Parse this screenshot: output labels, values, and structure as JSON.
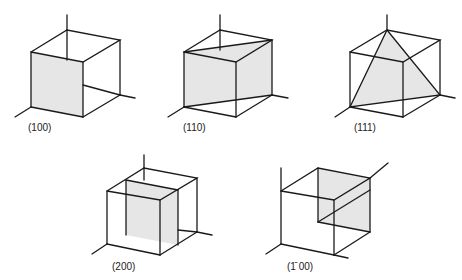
{
  "figure": {
    "panels": [
      {
        "id": "p100",
        "label": "(100)"
      },
      {
        "id": "p110",
        "label": "(110)"
      },
      {
        "id": "p111",
        "label": "(111)"
      },
      {
        "id": "p200",
        "label": "(200)"
      },
      {
        "id": "pbar100",
        "label": "(̄100)",
        "display_label": "(1̄ 00)"
      }
    ]
  },
  "colors": {
    "edge": "#1a1a1a",
    "plane_fill": "#e6e6e6",
    "background": "#ffffff"
  }
}
